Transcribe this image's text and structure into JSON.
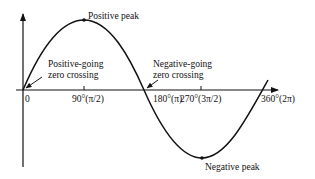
{
  "diagram": {
    "colors": {
      "line": "#111111",
      "background": "#ffffff"
    },
    "annotations": {
      "positive_peak": "Positive peak",
      "positive_going_line1": "Positive-going",
      "positive_going_line2": "zero crossing",
      "negative_going_line1": "Negative-going",
      "negative_going_line2": "zero crossing",
      "negative_peak": "Negative peak"
    },
    "x_ticks": [
      {
        "label": "0"
      },
      {
        "label": "90°(π/2)"
      },
      {
        "label": "180°(π)"
      },
      {
        "label": "270°(3π/2)"
      },
      {
        "label": "360°(2π)"
      }
    ]
  }
}
